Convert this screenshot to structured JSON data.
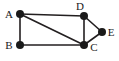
{
  "figure": {
    "width": 119,
    "height": 61,
    "background_color": "#ffffff",
    "edge_color": "#231f20",
    "node_color": "#1a1a1a",
    "label_color": "#1a1a1a",
    "node_radius": 4,
    "edge_width": 1.6
  },
  "graph": {
    "nodes": [
      {
        "id": "A",
        "label": "A",
        "cx": 20,
        "cy": 14,
        "label_x": 9,
        "label_y": 14
      },
      {
        "id": "B",
        "label": "B",
        "cx": 20,
        "cy": 45,
        "label_x": 9,
        "label_y": 45
      },
      {
        "id": "C",
        "label": "C",
        "cx": 84,
        "cy": 45,
        "label_x": 94,
        "label_y": 47
      },
      {
        "id": "D",
        "label": "D",
        "cx": 84,
        "cy": 16,
        "label_x": 80,
        "label_y": 6
      },
      {
        "id": "E",
        "label": "E",
        "cx": 102,
        "cy": 32,
        "label_x": 111,
        "label_y": 32
      }
    ],
    "edges": [
      {
        "from": "A",
        "to": "D"
      },
      {
        "from": "A",
        "to": "B"
      },
      {
        "from": "A",
        "to": "C"
      },
      {
        "from": "B",
        "to": "C"
      },
      {
        "from": "D",
        "to": "C"
      },
      {
        "from": "D",
        "to": "E"
      },
      {
        "from": "E",
        "to": "C"
      }
    ]
  }
}
